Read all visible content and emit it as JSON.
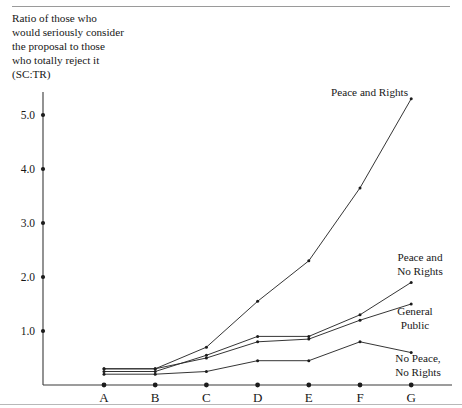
{
  "caption": "Ratio of those who\nwould seriously consider\nthe proposal to those\nwho totally reject it\n(SC:TR)",
  "axis": {
    "y_ticks": [
      "1.0",
      "2.0",
      "3.0",
      "4.0",
      "5.0"
    ],
    "x_ticks": [
      "A",
      "B",
      "C",
      "D",
      "E",
      "F",
      "G"
    ]
  },
  "labels": {
    "peace_and_rights": "Peace and Rights",
    "peace_and_no_rights": "Peace and\nNo Rights",
    "general_public": "General\nPublic",
    "no_peace_no_rights": "No Peace,\nNo Rights"
  },
  "chart_data": {
    "type": "line",
    "title": "Ratio of those who would seriously consider the proposal to those who totally reject it (SC:TR)",
    "xlabel": "",
    "ylabel": "Ratio (SC:TR)",
    "categories": [
      "A",
      "B",
      "C",
      "D",
      "E",
      "F",
      "G"
    ],
    "ylim": [
      0,
      5.6
    ],
    "yticks": [
      1.0,
      2.0,
      3.0,
      4.0,
      5.0
    ],
    "grid": false,
    "legend": "inline-right",
    "markers": true,
    "series": [
      {
        "name": "Peace and Rights",
        "values": [
          0.3,
          0.3,
          0.7,
          1.55,
          2.3,
          3.65,
          5.3
        ]
      },
      {
        "name": "Peace and No Rights",
        "values": [
          0.25,
          0.25,
          0.55,
          0.9,
          0.9,
          1.3,
          1.9
        ]
      },
      {
        "name": "General Public",
        "values": [
          0.3,
          0.3,
          0.5,
          0.8,
          0.85,
          1.2,
          1.5
        ]
      },
      {
        "name": "No Peace, No Rights",
        "values": [
          0.2,
          0.2,
          0.25,
          0.45,
          0.45,
          0.8,
          0.6
        ]
      }
    ]
  }
}
